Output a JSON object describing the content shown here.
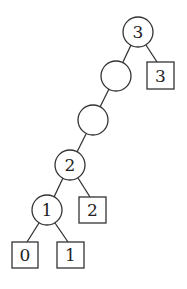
{
  "diagram": {
    "type": "binary-tree",
    "nodes": [
      {
        "id": "n3",
        "shape": "circle",
        "label": "3",
        "cx": 138,
        "cy": 32
      },
      {
        "id": "e1",
        "shape": "circle",
        "label": "",
        "cx": 116,
        "cy": 76
      },
      {
        "id": "e2",
        "shape": "circle",
        "label": "",
        "cx": 93,
        "cy": 120
      },
      {
        "id": "n2",
        "shape": "circle",
        "label": "2",
        "cx": 70,
        "cy": 165
      },
      {
        "id": "n1",
        "shape": "circle",
        "label": "1",
        "cx": 47,
        "cy": 210
      },
      {
        "id": "l3",
        "shape": "square",
        "label": "3",
        "cx": 160,
        "cy": 75
      },
      {
        "id": "l2",
        "shape": "square",
        "label": "2",
        "cx": 92,
        "cy": 210
      },
      {
        "id": "l0",
        "shape": "square",
        "label": "0",
        "cx": 25,
        "cy": 255
      },
      {
        "id": "l1",
        "shape": "square",
        "label": "1",
        "cx": 70,
        "cy": 255
      }
    ],
    "edges": [
      [
        "n3",
        "e1"
      ],
      [
        "n3",
        "l3"
      ],
      [
        "e1",
        "e2"
      ],
      [
        "e2",
        "n2"
      ],
      [
        "n2",
        "n1"
      ],
      [
        "n2",
        "l2"
      ],
      [
        "n1",
        "l0"
      ],
      [
        "n1",
        "l1"
      ]
    ],
    "labels": {
      "root": "3",
      "leaf_right_top": "3",
      "node_2": "2",
      "leaf_2": "2",
      "node_1": "1",
      "leaf_0": "0",
      "leaf_1": "1"
    }
  }
}
